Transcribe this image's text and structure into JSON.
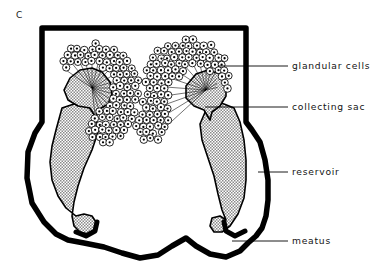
{
  "figure": {
    "panel_label": "C",
    "type": "anatomical-line-diagram",
    "background_color": "#ffffff",
    "ink_color": "#000000",
    "fill_color": "#d8d8d8"
  },
  "callouts": [
    {
      "id": "glandular-cells",
      "label": "glandular cells",
      "leader": {
        "x1": 218,
        "y1": 66,
        "x2": 288,
        "y2": 66
      },
      "text_x": 292,
      "text_y": 69
    },
    {
      "id": "collecting-sac",
      "label": "collecting sac",
      "leader": {
        "x1": 205,
        "y1": 107,
        "x2": 288,
        "y2": 107
      },
      "text_x": 292,
      "text_y": 110
    },
    {
      "id": "reservoir",
      "label": "reservoir",
      "leader": {
        "x1": 258,
        "y1": 172,
        "x2": 288,
        "y2": 172
      },
      "text_x": 292,
      "text_y": 175
    },
    {
      "id": "meatus",
      "label": "meatus",
      "leader": {
        "x1": 232,
        "y1": 241,
        "x2": 288,
        "y2": 241
      },
      "text_x": 292,
      "text_y": 244
    }
  ],
  "structures": [
    {
      "id": "body-wall",
      "name": "body wall outline"
    },
    {
      "id": "glandular-cell-cluster-left",
      "name": "left glandular cell cluster"
    },
    {
      "id": "glandular-cell-cluster-right",
      "name": "right glandular cell cluster"
    },
    {
      "id": "collecting-sac-left",
      "name": "left collecting sac"
    },
    {
      "id": "collecting-sac-right",
      "name": "right collecting sac"
    },
    {
      "id": "reservoir-left",
      "name": "left reservoir"
    },
    {
      "id": "reservoir-right",
      "name": "right reservoir"
    },
    {
      "id": "meatus-opening",
      "name": "meatus opening"
    }
  ]
}
